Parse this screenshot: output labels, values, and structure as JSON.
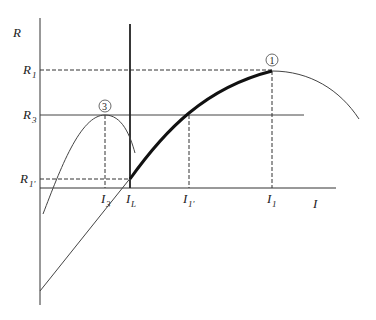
{
  "diagram": {
    "axes": {
      "y_label": "R",
      "x_label": "I"
    },
    "y_levels": [
      {
        "id": "R1",
        "base": "R",
        "sub": "1"
      },
      {
        "id": "R3",
        "base": "R",
        "sub": "3"
      },
      {
        "id": "R1p",
        "base": "R",
        "sub": "1'"
      }
    ],
    "x_levels": [
      {
        "id": "I3",
        "base": "I",
        "sub": "3"
      },
      {
        "id": "IL",
        "base": "I",
        "sub": "L"
      },
      {
        "id": "I1p",
        "base": "I",
        "sub": "1'"
      },
      {
        "id": "I1",
        "base": "I",
        "sub": "1"
      }
    ],
    "markers": [
      {
        "id": "point-1",
        "label": "1"
      },
      {
        "id": "point-3",
        "label": "3"
      }
    ],
    "colors": {
      "line": "#222222",
      "thin_line": "#444444",
      "background": "#ffffff"
    }
  }
}
